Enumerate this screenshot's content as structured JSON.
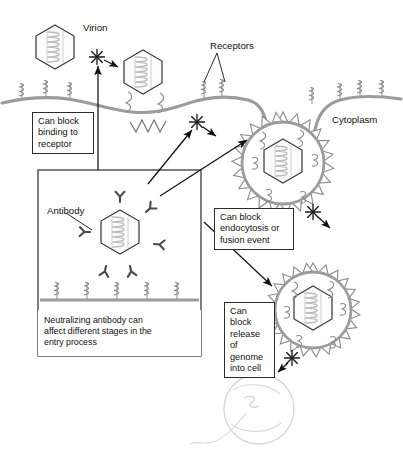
{
  "figure": {
    "canvas": {
      "width": 403,
      "height": 474,
      "background": "#ffffff"
    },
    "colors": {
      "membrane": "#9c9c9c",
      "virion_outline": "#3a3a3a",
      "genome_coil": "#b8b8b8",
      "antibody": "#4a4a4a",
      "endosome_spike": "#8e8e8e",
      "nucleus": "#d9d9d9",
      "text": "#111111",
      "box_border": "#2b2b2b",
      "arrow": "#111111"
    }
  },
  "labels": {
    "virion": "Virion",
    "receptors": "Receptors",
    "cytoplasm": "Cytoplasm",
    "antibody": "Antibody"
  },
  "callouts": {
    "block_binding": "Can block\nbinding to\nreceptor",
    "block_endocytosis": "Can block\nendocytosis or\nfusion event",
    "block_release": "Can block\nrelease of\ngenome\ninto cell"
  },
  "inset": {
    "caption": "Neutralizing antibody can\naffect different stages in the\nentry process",
    "receptor_count": 5,
    "antibody_count": 6
  },
  "icons": {
    "block_marker": "blocking-asterisk-icon",
    "virion": "hexagonal-virion-icon",
    "receptor": "coiled-receptor-icon",
    "antibody": "y-shaped-antibody-icon",
    "endosome": "spiky-coated-vesicle-icon",
    "nucleus": "nucleus-icon",
    "fusion_zigzag": "fusion-zigzag-icon"
  },
  "stages": [
    {
      "name": "free-virion",
      "blocked": true,
      "block_label": "Can block binding to receptor"
    },
    {
      "name": "receptor-bound-virion",
      "blocked": false
    },
    {
      "name": "endocytosis-vesicle",
      "blocked": true,
      "block_label": "Can block endocytosis or fusion event"
    },
    {
      "name": "endosome-with-virion",
      "blocked": true,
      "block_label": "Can block release of genome into cell"
    },
    {
      "name": "nucleus-genome-delivery",
      "blocked": false
    }
  ]
}
